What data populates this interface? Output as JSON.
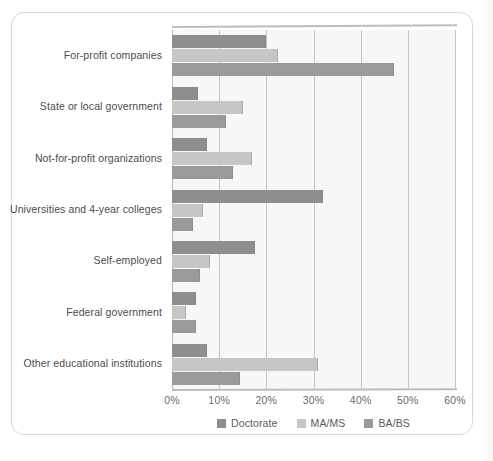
{
  "chart_data": {
    "type": "bar",
    "orientation": "horizontal",
    "grouped": true,
    "title": "",
    "subtitle": "",
    "xlabel": "",
    "ylabel": "",
    "xlim": [
      0,
      60
    ],
    "xtick_labels": [
      "0%",
      "10%",
      "20%",
      "30%",
      "40%",
      "50%",
      "60%"
    ],
    "xtick_values": [
      0,
      10,
      20,
      30,
      40,
      50,
      60
    ],
    "grid": "vertical",
    "legend_position": "bottom",
    "categories": [
      "For-profit companies",
      "State or local government",
      "Not-for-profit organizations",
      "Universities and 4-year colleges",
      "Self-employed",
      "Federal government",
      "Other educational institutions"
    ],
    "series": [
      {
        "name": "Doctorate",
        "color": "#8e8e8e",
        "values": [
          20.0,
          5.5,
          7.5,
          32.0,
          17.5,
          5.0,
          7.5
        ]
      },
      {
        "name": "MA/MS",
        "color": "#c6c6c6",
        "values": [
          22.5,
          15.0,
          17.0,
          6.5,
          8.0,
          3.0,
          31.0
        ]
      },
      {
        "name": "BA/BS",
        "color": "#9a9a9a",
        "values": [
          47.0,
          11.5,
          13.0,
          4.5,
          6.0,
          5.0,
          14.5
        ]
      }
    ],
    "legend": [
      {
        "label": "Doctorate",
        "color": "#8e8e8e"
      },
      {
        "label": "MA/MS",
        "color": "#c6c6c6"
      },
      {
        "label": "BA/BS",
        "color": "#9a9a9a"
      }
    ]
  }
}
